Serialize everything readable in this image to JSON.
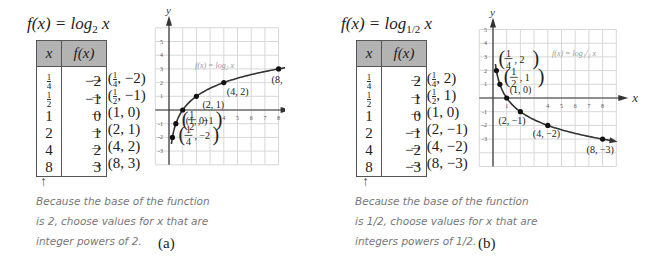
{
  "panel_a": {
    "title": {
      "prefix": "f(x) = log",
      "base": "2",
      "suffix": " x"
    },
    "table": {
      "headers": [
        "x",
        "f(x)"
      ],
      "rows": [
        {
          "x": "1/4",
          "fx": "−2",
          "pair": "→ (1/4, −2)"
        },
        {
          "x": "1/2",
          "fx": "−1",
          "pair": "→ (1/2, −1)"
        },
        {
          "x": "1",
          "fx": "0",
          "pair": "→ (1, 0)"
        },
        {
          "x": "2",
          "fx": "1",
          "pair": "→ (2, 1)"
        },
        {
          "x": "4",
          "fx": "2",
          "pair": "→ (4, 2)"
        },
        {
          "x": "8",
          "fx": "3",
          "pair": "→ (8, 3)"
        }
      ]
    },
    "arrow": "↑",
    "note": [
      "Because the base of the function",
      "is 2, choose values for x that are",
      "integer powers of 2."
    ],
    "caption": "(a)"
  },
  "panel_b": {
    "title": {
      "prefix": "f(x) = log",
      "base": "1/2",
      "suffix": " x"
    },
    "table": {
      "headers": [
        "x",
        "f(x)"
      ],
      "rows": [
        {
          "x": "1/4",
          "fx": "2",
          "pair": "→ (1/4, 2)"
        },
        {
          "x": "1/2",
          "fx": "1",
          "pair": "→ (1/2, 1)"
        },
        {
          "x": "1",
          "fx": "0",
          "pair": "→ (1, 0)"
        },
        {
          "x": "2",
          "fx": "−1",
          "pair": "→ (2, −1)"
        },
        {
          "x": "4",
          "fx": "−2",
          "pair": "→ (4, −2)"
        },
        {
          "x": "8",
          "fx": "−3",
          "pair": "→ (8, −3)"
        }
      ]
    },
    "arrow": "↑",
    "note": [
      "Because the base of the function",
      "is 1/2, choose values for x that are",
      "integers powers of 1/2."
    ],
    "caption": "(b)"
  },
  "chart_data": [
    {
      "type": "line",
      "title": "",
      "function_label": "f(x) = log₂ x",
      "xlabel": "x",
      "ylabel": "y",
      "xlim": [
        -1,
        8
      ],
      "ylim": [
        -4,
        6
      ],
      "x_ticks": [
        "4",
        "5",
        "6",
        "7",
        "8"
      ],
      "y_ticks": [
        "5",
        "4",
        "3",
        "2",
        "1",
        "-1",
        "-2",
        "-3"
      ],
      "grid": true,
      "points": [
        {
          "x": 0.25,
          "y": -2,
          "label": "(1/4, −2)"
        },
        {
          "x": 0.5,
          "y": -1,
          "label": "(1/2, −1)"
        },
        {
          "x": 1,
          "y": 0,
          "label": "(1, 0)"
        },
        {
          "x": 2,
          "y": 1,
          "label": "(2, 1)"
        },
        {
          "x": 4,
          "y": 2,
          "label": "(4, 2)"
        },
        {
          "x": 8,
          "y": 3,
          "label": "(8, 3)"
        }
      ],
      "color": "#333333"
    },
    {
      "type": "line",
      "title": "",
      "function_label": "f(x) = log₁/₂ x",
      "xlabel": "x",
      "ylabel": "y",
      "xlim": [
        -1,
        9
      ],
      "ylim": [
        -5,
        5
      ],
      "x_ticks": [
        "1",
        "4",
        "5",
        "6",
        "7",
        "8"
      ],
      "y_ticks": [
        "5",
        "4",
        "3",
        "2",
        "1",
        "-1",
        "-2",
        "-3"
      ],
      "grid": true,
      "points": [
        {
          "x": 0.25,
          "y": 2,
          "label": "(1/4, 2)"
        },
        {
          "x": 0.5,
          "y": 1,
          "label": "(1/2, 1)"
        },
        {
          "x": 1,
          "y": 0,
          "label": "(1, 0)"
        },
        {
          "x": 2,
          "y": -1,
          "label": "(2, −1)"
        },
        {
          "x": 4,
          "y": -2,
          "label": "(4, −2)"
        },
        {
          "x": 8,
          "y": -3,
          "label": "(8, −3)"
        }
      ],
      "color": "#333333"
    }
  ]
}
